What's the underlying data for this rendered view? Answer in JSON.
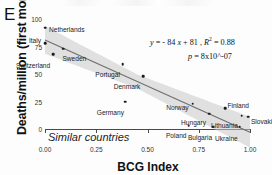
{
  "panel": {
    "letter": "E"
  },
  "chart_data": {
    "type": "scatter",
    "title": "",
    "subtitle": "Similar countries",
    "xlabel": "BCG Index",
    "ylabel": "Deaths/million (first month)",
    "xlim": [
      0.0,
      1.0
    ],
    "ylim": [
      0,
      100
    ],
    "xticks": [
      "0.00",
      "0.25",
      "0.50",
      "0.75",
      "1.00"
    ],
    "xtick_values": [
      0.0,
      0.25,
      0.5,
      0.75,
      1.0
    ],
    "yticks": [
      "0",
      "25",
      "50",
      "75",
      "100"
    ],
    "ytick_values": [
      0,
      25,
      50,
      75,
      100
    ],
    "grid": false,
    "legend": "none",
    "points": [
      {
        "name": "Netherlands",
        "x": 0.0,
        "y": 92,
        "label_dx": 4,
        "label_dy": -1
      },
      {
        "name": "Italy",
        "x": 0.0,
        "y": 78,
        "label_dx": -4,
        "label_dy": -5,
        "align": "right"
      },
      {
        "name": "Sweden",
        "x": 0.09,
        "y": 73,
        "label_dx": -1,
        "label_dy": 7
      },
      {
        "name": "Switzerland",
        "x": 0.04,
        "y": 68,
        "label_dx": -3,
        "label_dy": 9,
        "align": "right"
      },
      {
        "name": "Portugal",
        "x": 0.38,
        "y": 59,
        "label_dx": -3,
        "label_dy": 8,
        "align": "right"
      },
      {
        "name": "Denmark",
        "x": 0.48,
        "y": 48,
        "label_dx": -3,
        "label_dy": 8,
        "align": "right"
      },
      {
        "name": "Germany",
        "x": 0.39,
        "y": 25,
        "label_dx": -1,
        "label_dy": 8,
        "align": "right"
      },
      {
        "name": "Norway",
        "x": 0.72,
        "y": 23,
        "label_dx": -4,
        "label_dy": 1,
        "align": "right"
      },
      {
        "name": "Finland",
        "x": 0.88,
        "y": 19,
        "label_dx": 2,
        "label_dy": -5
      },
      {
        "name": "Hungary",
        "x": 0.8,
        "y": 14,
        "label_dx": -3,
        "label_dy": 6,
        "align": "right"
      },
      {
        "name": "Lithuania",
        "x": 0.96,
        "y": 12,
        "label_dx": -4,
        "label_dy": 7,
        "align": "right"
      },
      {
        "name": "Poland",
        "x": 0.7,
        "y": 3,
        "label_dx": -2,
        "label_dy": 7,
        "align": "right"
      },
      {
        "name": "Bulgaria",
        "x": 0.82,
        "y": 2,
        "label_dx": -1,
        "label_dy": 8,
        "align": "right"
      },
      {
        "name": "Ukraine",
        "x": 0.95,
        "y": 2,
        "label_dx": -2,
        "label_dy": 9,
        "align": "right"
      },
      {
        "name": "Slovakia",
        "x": 0.99,
        "y": 11,
        "label_dx": 3,
        "label_dy": 2
      }
    ],
    "fit": {
      "slope": -84,
      "intercept": 81,
      "r_squared": 0.88,
      "p_value": "8x10^-07",
      "equation_text": "y = - 84 x + 81 ,  R  = 0.88",
      "p_text": "p = 8x10^-07",
      "band_visible": true
    },
    "annotations": {
      "equation_y": "y",
      "equation_body": " = - 84 ",
      "equation_x": "x",
      "equation_tail": " + 81 ,  ",
      "equation_r": "R",
      "equation_rsup": "2",
      "equation_req": " = 0.88",
      "p_label": "p",
      "p_rest": " = 8x10^-07"
    }
  },
  "colors": {
    "point": "#1b1b1b",
    "fit_line": "#6d6d6d",
    "band": "#c9c9c9",
    "axis": "#4a4a4a",
    "text": "#1a1a1a"
  }
}
